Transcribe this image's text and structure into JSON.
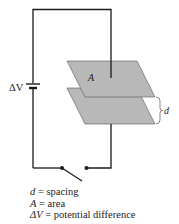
{
  "diagram": {
    "battery_label": "ΔV",
    "plate_label": "A",
    "spacing_label": "d",
    "colors": {
      "plate_fill": "#b8b8b8",
      "wire": "#1a1a1a",
      "text": "#222222"
    }
  },
  "legend": {
    "items": [
      {
        "symbol": "d",
        "equals": " = ",
        "meaning": "spacing"
      },
      {
        "symbol": "A",
        "equals": " = ",
        "meaning": "area"
      },
      {
        "symbol": "ΔV",
        "equals": " = ",
        "meaning": "potential difference"
      }
    ]
  }
}
